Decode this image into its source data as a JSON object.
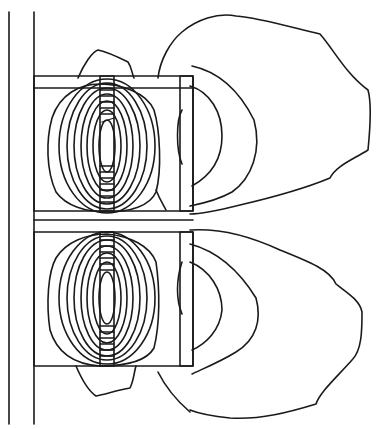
{
  "diagram": {
    "type": "field-contour-plot",
    "background": "#ffffff",
    "line_color": "#1a1a1a",
    "axis_lines": [
      {
        "name": "axis-line-left",
        "x": 9,
        "y1": 12,
        "y2": 424
      },
      {
        "name": "core-edge-line",
        "x": 34,
        "y1": 12,
        "y2": 424
      }
    ],
    "windows": [
      {
        "name": "upper-window",
        "x": 34,
        "y": 76,
        "w": 159,
        "h": 135,
        "inner_top": 88
      },
      {
        "name": "lower-window",
        "x": 34,
        "y": 232,
        "w": 159,
        "h": 134,
        "inner_top": 234
      }
    ],
    "coils": [
      {
        "name": "upper-inner-coil",
        "x": 100,
        "y": 76,
        "w": 14,
        "h": 135,
        "hatch_step": 6
      },
      {
        "name": "upper-outer-coil",
        "x": 180,
        "y": 76,
        "w": 13,
        "h": 135
      },
      {
        "name": "lower-inner-coil",
        "x": 100,
        "y": 232,
        "w": 14,
        "h": 134,
        "hatch_step": 6
      },
      {
        "name": "lower-outer-coil",
        "x": 180,
        "y": 232,
        "w": 13,
        "h": 134
      }
    ],
    "contour_rings_per_pole": 9
  }
}
